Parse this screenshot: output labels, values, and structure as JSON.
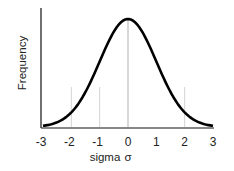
{
  "chart_data": {
    "type": "line",
    "title": "",
    "xlabel": "sigma",
    "xlabel_symbol": "σ",
    "ylabel": "Frequency",
    "xlim": [
      -3,
      3
    ],
    "ylim": [
      0,
      1
    ],
    "x_ticks": [
      -3,
      -2,
      -1,
      0,
      1,
      2,
      3
    ],
    "x_tick_labels": [
      "-3",
      "-2",
      "-1",
      "0",
      "1",
      "2",
      "3"
    ],
    "y_ticks": [],
    "gridlines_x": [
      -2,
      -1,
      0,
      2
    ],
    "grid": true,
    "legend": "none",
    "series": [
      {
        "name": "normal distribution",
        "function": "standard normal pdf (normalized to peak 1)",
        "x": [
          -3,
          -2.5,
          -2,
          -1.5,
          -1,
          -0.5,
          0,
          0.5,
          1,
          1.5,
          2,
          2.5,
          3
        ],
        "y": [
          0.011,
          0.044,
          0.135,
          0.325,
          0.607,
          0.882,
          1.0,
          0.882,
          0.607,
          0.325,
          0.135,
          0.044,
          0.011
        ],
        "color": "#000000"
      }
    ]
  }
}
